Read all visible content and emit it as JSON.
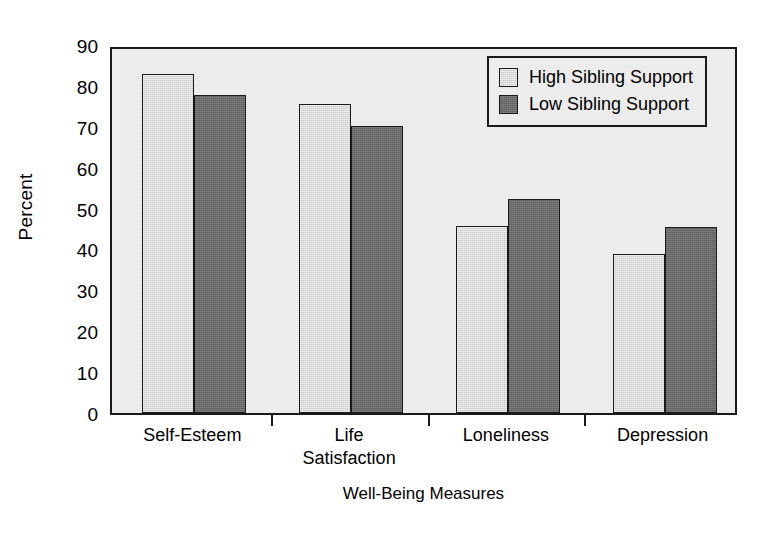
{
  "chart_data": {
    "type": "bar",
    "title": "",
    "xlabel": "Well-Being Measures",
    "ylabel": "Percent",
    "categories": [
      "Self-Esteem",
      "Life\nSatisfaction",
      "Loneliness",
      "Depression"
    ],
    "ylim": [
      0,
      90
    ],
    "yticks": [
      0,
      10,
      20,
      30,
      40,
      50,
      60,
      70,
      80,
      90
    ],
    "ytick_labels": [
      "0",
      "10",
      "20",
      "30",
      "40",
      "50",
      "60",
      "70",
      "80",
      "90"
    ],
    "grid": false,
    "legend_position": "top-right",
    "series": [
      {
        "name": "High Sibling Support",
        "color": "#c9c9c9",
        "values": [
          83.0,
          75.6,
          45.8,
          39.0
        ]
      },
      {
        "name": "Low Sibling Support",
        "color": "#6b6b6b",
        "values": [
          77.8,
          70.2,
          52.3,
          45.4
        ]
      }
    ]
  },
  "figure": {
    "background_color": "#ffffff",
    "plot_background_color": "#ececec",
    "axis_color": "#1a1a1a"
  }
}
